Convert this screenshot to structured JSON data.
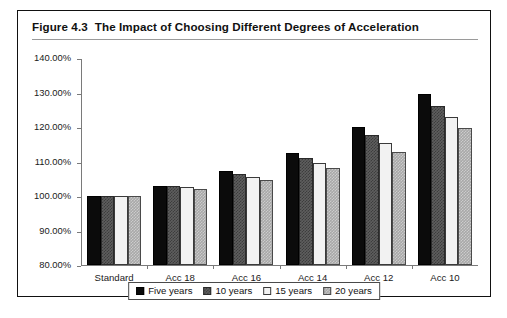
{
  "figure": {
    "number": "Figure 4.3",
    "title": "The Impact of Choosing Different Degrees of Acceleration"
  },
  "chart_data": {
    "type": "bar",
    "title": "The Impact of Choosing Different Degrees of Acceleration",
    "xlabel": "",
    "ylabel": "",
    "ylim": [
      80,
      140
    ],
    "ytick_labels": [
      "140.00%",
      "130.00%",
      "120.00%",
      "110.00%",
      "100.00%",
      "90.00%",
      "80.00%"
    ],
    "ytick_values": [
      140,
      130,
      120,
      110,
      100,
      90,
      80
    ],
    "grid": false,
    "legend_position": "bottom",
    "categories": [
      "Standard",
      "Acc 18",
      "Acc 16",
      "Acc 14",
      "Acc 12",
      "Acc 10"
    ],
    "series": [
      {
        "name": "Five years",
        "color": "#0b0b0b",
        "values": [
          100.0,
          103.0,
          107.3,
          112.5,
          120.0,
          129.7
        ]
      },
      {
        "name": "10 years",
        "color": "#5e5e5e",
        "values": [
          100.0,
          102.8,
          106.3,
          111.0,
          117.7,
          126.0
        ]
      },
      {
        "name": "15 years",
        "color": "#f2f2f2",
        "values": [
          100.0,
          102.5,
          105.5,
          109.7,
          115.3,
          123.0
        ]
      },
      {
        "name": "20 years",
        "color": "#a8a8a8",
        "values": [
          100.0,
          102.0,
          104.7,
          108.0,
          112.7,
          119.7
        ]
      }
    ]
  }
}
